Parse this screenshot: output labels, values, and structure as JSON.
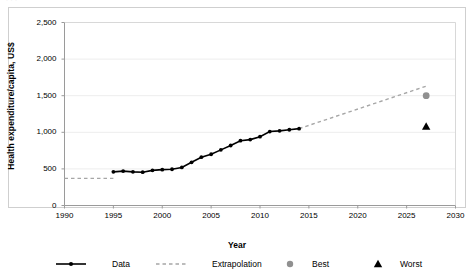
{
  "top_caption_fragment": "· · ·",
  "chart_data": {
    "type": "line",
    "title": "",
    "xlabel": "Year",
    "ylabel": "Health expenditure/capita, US$",
    "xlim": [
      1990,
      2030
    ],
    "ylim": [
      0,
      2500
    ],
    "xticks": [
      "1990",
      "1995",
      "2000",
      "2005",
      "2010",
      "2015",
      "2020",
      "2025",
      "2030"
    ],
    "xtick_values": [
      1990,
      1995,
      2000,
      2005,
      2010,
      2015,
      2020,
      2025,
      2030
    ],
    "yticks": [
      "0",
      "500",
      "1,000",
      "1,500",
      "2,000",
      "2,500"
    ],
    "ytick_values": [
      0,
      500,
      1000,
      1500,
      2000,
      2500
    ],
    "grid": "horizontal-faint",
    "legend_position": "bottom",
    "series": [
      {
        "name": "Data",
        "style": "solid-line-with-markers",
        "color": "#000000",
        "marker": "circle",
        "x": [
          1995,
          1996,
          1997,
          1998,
          1999,
          2000,
          2001,
          2002,
          2003,
          2004,
          2005,
          2006,
          2007,
          2008,
          2009,
          2010,
          2011,
          2012,
          2013,
          2014
        ],
        "values": [
          460,
          470,
          460,
          455,
          480,
          490,
          495,
          520,
          590,
          660,
          700,
          760,
          820,
          885,
          900,
          940,
          1010,
          1020,
          1035,
          1050
        ]
      },
      {
        "name": "Extrapolation",
        "style": "dashed-line",
        "color": "#a6a6a6",
        "segments": [
          {
            "x": [
              1990,
              1995
            ],
            "values": [
              370,
              370
            ]
          },
          {
            "x": [
              2014,
              2027
            ],
            "values": [
              1050,
              1630
            ]
          }
        ]
      },
      {
        "name": "Best",
        "style": "marker-only",
        "color": "#909090",
        "marker": "circle",
        "x": [
          2027
        ],
        "values": [
          1500
        ]
      },
      {
        "name": "Worst",
        "style": "marker-only",
        "color": "#000000",
        "marker": "triangle",
        "x": [
          2027
        ],
        "values": [
          1080
        ]
      }
    ]
  },
  "legend": {
    "items": [
      {
        "label": "Data",
        "marker": "line-circle",
        "color": "#000000"
      },
      {
        "label": "Extrapolation",
        "marker": "dashed-line",
        "color": "#a6a6a6"
      },
      {
        "label": "Best",
        "marker": "circle",
        "color": "#909090"
      },
      {
        "label": "Worst",
        "marker": "triangle",
        "color": "#000000"
      }
    ]
  }
}
